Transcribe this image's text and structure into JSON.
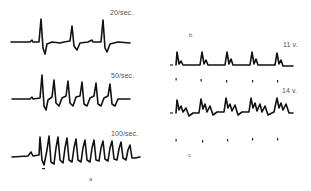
{
  "figure": {
    "panel_a": {
      "label": "a",
      "traces": [
        {
          "rate_label": "20/sec.",
          "spikes": 3
        },
        {
          "rate_label": "50/sec.",
          "spikes": 6
        },
        {
          "rate_label": "100/sec.",
          "spikes": 11
        }
      ]
    },
    "panel_b": {
      "label": "b",
      "voltage_label": "11 v.",
      "responses": 5,
      "stimulus_marks": 5
    },
    "panel_c": {
      "label": "c",
      "voltage_label": "14 v.",
      "responses": 5,
      "stimulus_marks": 5
    }
  }
}
